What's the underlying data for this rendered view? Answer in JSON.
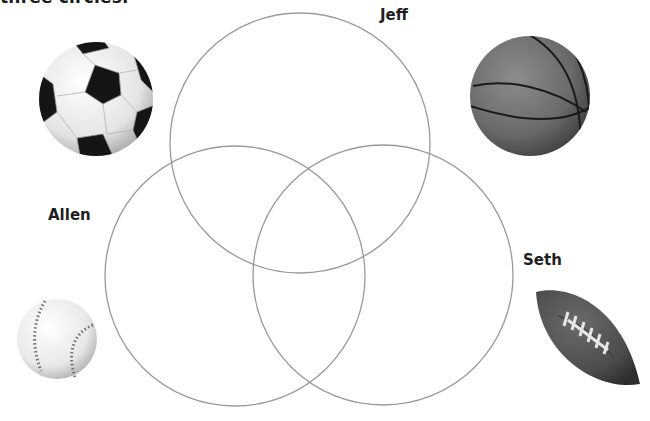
{
  "heading": {
    "text": "three circles."
  },
  "venn": {
    "stroke_color": "#9a9a9a",
    "circles": [
      {
        "name": "Jeff",
        "cx": 300,
        "cy": 143,
        "r": 130
      },
      {
        "name": "Allen",
        "cx": 235,
        "cy": 276,
        "r": 130
      },
      {
        "name": "Seth",
        "cx": 383,
        "cy": 275,
        "r": 130
      }
    ]
  },
  "labels": {
    "jeff": "Jeff",
    "allen": "Allen",
    "seth": "Seth"
  },
  "images": [
    {
      "icon": "soccer-ball-icon"
    },
    {
      "icon": "basketball-icon"
    },
    {
      "icon": "baseball-icon"
    },
    {
      "icon": "football-icon"
    }
  ]
}
